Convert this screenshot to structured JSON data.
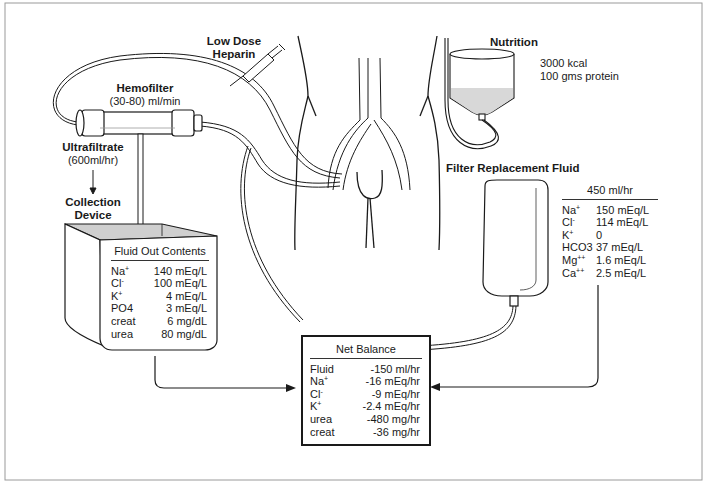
{
  "diagram": {
    "type": "CVVH continuous hemofiltration schematic",
    "labels": {
      "heparin_line1": "Low Dose",
      "heparin_line2": "Heparin",
      "hemofilter": "Hemofilter",
      "hemofilter_rate": "(30-80) ml/min",
      "ultrafiltrate": "Ultrafiltrate",
      "ultrafiltrate_rate": "(600ml/hr)",
      "collection_line1": "Collection",
      "collection_line2": "Device",
      "nutrition": "Nutrition",
      "nutrition_kcal": "3000 kcal",
      "nutrition_protein": "100 gms protein",
      "replacement": "Filter Replacement Fluid"
    },
    "fluid_out": {
      "title": "Fluid Out Contents",
      "rows": [
        {
          "k": "Na",
          "sup": "+",
          "v": "140 mEq/L"
        },
        {
          "k": "Cl",
          "sup": "-",
          "v": "100 mEq/L"
        },
        {
          "k": "K",
          "sup": "+",
          "v": "4 mEq/L"
        },
        {
          "k": "PO4",
          "sup": "",
          "v": "3 mEq/L"
        },
        {
          "k": "creat",
          "sup": "",
          "v": "6 mg/dL"
        },
        {
          "k": "urea",
          "sup": "",
          "v": "80 mg/dL"
        }
      ]
    },
    "replacement_fluid": {
      "title": "450 ml/hr",
      "rows": [
        {
          "k": "Na",
          "sup": "+",
          "v": "150 mEq/L"
        },
        {
          "k": "Cl",
          "sup": "-",
          "v": "114 mEq/L"
        },
        {
          "k": "K",
          "sup": "+",
          "v": "0"
        },
        {
          "k": "HCO3",
          "sup": "",
          "v": "37 mEq/L"
        },
        {
          "k": "Mg",
          "sup": "++",
          "v": "1.6 mEq/L"
        },
        {
          "k": "Ca",
          "sup": "++",
          "v": "2.5 mEq/L"
        }
      ]
    },
    "net_balance": {
      "title": "Net Balance",
      "rows": [
        {
          "k": "Fluid",
          "sup": "",
          "v": "-150 ml/hr"
        },
        {
          "k": "Na",
          "sup": "+",
          "v": "-16 mEq/hr"
        },
        {
          "k": "Cl",
          "sup": "-",
          "v": "-9 mEq/hr"
        },
        {
          "k": "K",
          "sup": "+",
          "v": "-2.4 mEq/hr"
        },
        {
          "k": "urea",
          "sup": "",
          "v": "-480 mg/hr"
        },
        {
          "k": "creat",
          "sup": "",
          "v": "-36 mg/hr"
        }
      ]
    },
    "colors": {
      "line": "#1a1a1a",
      "frame": "#9a9a9a",
      "fluid_fill": "#d8d8d8"
    }
  }
}
